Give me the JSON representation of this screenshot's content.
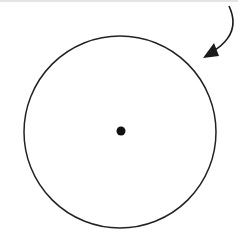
{
  "diagram": {
    "circle": {
      "cx": 120,
      "cy": 132,
      "r": 96,
      "stroke": "#222222"
    },
    "center_dot": {
      "cx": 121,
      "cy": 131,
      "r": 4.5,
      "fill": "#111111"
    },
    "arrow": {
      "path": "M 229 6 C 238 25, 232 40, 212 52",
      "head": "203,58 214,43 219,56",
      "stroke": "#1a1a1a"
    }
  }
}
